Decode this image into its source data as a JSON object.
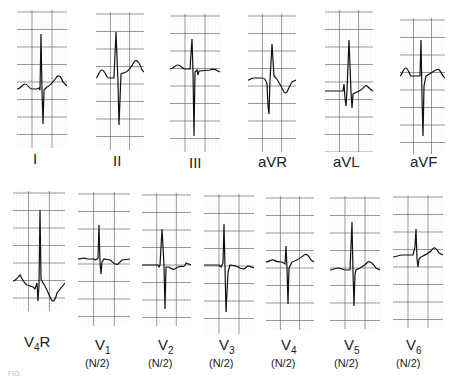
{
  "figure": {
    "caption_fragment": "FIG."
  },
  "leads": [
    {
      "id": "I",
      "label": "I",
      "sub": "",
      "x": 17,
      "y": 10,
      "w": 50,
      "h": 138,
      "baseline": 79,
      "trace": "M0,79 C4,79 5,74 8,74 C11,74 12,79 15,79 L20,79 L22,78 L23,80 L24,24 L25,80 L26,114 L27,80 L30,77 C33,76 36,72 39,68 C41,64 44,66 46,72 L50,76",
      "lx": 33,
      "ly": 150
    },
    {
      "id": "II",
      "label": "II",
      "sub": "",
      "x": 96,
      "y": 12,
      "w": 48,
      "h": 138,
      "baseline": 66,
      "trace": "M0,66 C2,66 3,58 6,58 C9,58 10,66 13,66 L18,66 L20,20 L22,70 L23,113 L25,62 L30,60 C34,58 36,54 38,50 C41,46 44,52 46,58 L48,60",
      "lx": 113,
      "ly": 152
    },
    {
      "id": "III",
      "label": "III",
      "sub": "",
      "x": 170,
      "y": 14,
      "w": 50,
      "h": 138,
      "baseline": 55,
      "trace": "M0,55 C3,55 5,51 8,51 C11,51 12,55 15,55 L20,55 L22,25 L23,58 L24,122 L25,58 L27,56 L28,61 L29,57 L40,56 C43,54 45,55 48,57 L50,58",
      "lx": 189,
      "ly": 154
    },
    {
      "id": "aVR",
      "label": "aVR",
      "sub": "",
      "x": 248,
      "y": 14,
      "w": 48,
      "h": 138,
      "baseline": 66,
      "trace": "M0,66 C2,66 3,64 6,64 L14,64 C17,64 18,66 19,70 L20,92 L21,100 L22,66 L24,30 L26,62 L28,64 C31,68 33,72 36,78 C39,82 41,72 44,68 L48,66",
      "lx": 258,
      "ly": 153
    },
    {
      "id": "aVL",
      "label": "aVL",
      "sub": "",
      "x": 325,
      "y": 10,
      "w": 48,
      "h": 142,
      "baseline": 81,
      "trace": "M0,81 L18,81 L19,74 L20,88 L21,96 L22,81 L24,30 L26,82 L27,98 L28,84 L34,81 C38,80 40,74 42,76 C44,78 46,80 48,81",
      "lx": 333,
      "ly": 153
    },
    {
      "id": "aVF",
      "label": "aVF",
      "sub": "",
      "x": 400,
      "y": 18,
      "w": 45,
      "h": 136,
      "baseline": 58,
      "trace": "M0,58 C2,58 3,50 6,50 C8,50 9,56 11,58 L20,58 L21,22 L22,78 L23,118 L24,68 L26,58 C30,56 32,54 36,52 C39,50 41,54 43,58 L45,60",
      "lx": 410,
      "ly": 153
    },
    {
      "id": "V4R",
      "label": "V",
      "sub": "4",
      "suffix": "R",
      "x": 13,
      "y": 191,
      "w": 52,
      "h": 120,
      "baseline": 90,
      "trace": "M0,90 C3,90 5,86 7,84 C9,88 11,92 14,94 L20,96 L22,98 L24,92 L25,110 L26,94 L27,19 L28,88 L30,92 C33,96 35,102 38,108 C40,112 42,110 44,102 L52,92",
      "lx": 24,
      "ly": 333,
      "nx": "",
      "ny": 0
    },
    {
      "id": "V1",
      "label": "V",
      "sub": "1",
      "suffix": "",
      "x": 78,
      "y": 192,
      "w": 52,
      "h": 134,
      "baseline": 67,
      "trace": "M0,67 C3,67 6,65 9,67 L16,67 C18,69 19,67 20,66 L21,33 L22,70 L23,82 L24,70 L26,67 L32,68 C35,70 37,74 40,72 L44,68 L52,67",
      "lx": 95,
      "ly": 336,
      "nx": "(N/2)",
      "ny": 357
    },
    {
      "id": "V2",
      "label": "V",
      "sub": "2",
      "suffix": "",
      "x": 142,
      "y": 193,
      "w": 49,
      "h": 133,
      "baseline": 72,
      "trace": "M0,72 L16,72 L17,74 L18,72 L20,36 L22,72 L23,116 L24,74 L27,74 C31,78 33,76 36,74 C40,72 42,76 44,70 L49,72",
      "lx": 158,
      "ly": 336,
      "nx": "(N/2)",
      "ny": 357
    },
    {
      "id": "V3",
      "label": "V",
      "sub": "3",
      "suffix": "",
      "x": 204,
      "y": 194,
      "w": 50,
      "h": 140,
      "baseline": 71,
      "trace": "M0,71 L15,71 L17,73 L19,69 L20,30 L21,74 L22,118 L24,78 L26,71 L32,72 L36,74 L40,75 L44,72 L50,74",
      "lx": 219,
      "ly": 336,
      "nx": "(N/2)",
      "ny": 357
    },
    {
      "id": "V4",
      "label": "V",
      "sub": "4",
      "suffix": "",
      "x": 266,
      "y": 196,
      "w": 48,
      "h": 134,
      "baseline": 66,
      "trace": "M0,66 C3,66 5,63 8,64 C10,66 12,66 16,66 L19,68 L20,50 L21,72 L22,108 L23,72 L26,66 C30,65 34,62 37,60 C40,56 43,60 45,64 L48,66",
      "lx": 281,
      "ly": 336,
      "nx": "(N/2)",
      "ny": 357
    },
    {
      "id": "V5",
      "label": "V",
      "sub": "5",
      "suffix": "",
      "x": 330,
      "y": 196,
      "w": 50,
      "h": 133,
      "baseline": 74,
      "trace": "M0,74 C3,74 5,72 8,72 C11,72 13,74 16,74 L20,74 L22,26 L23,76 L24,110 L25,78 L26,74 L30,72 C34,70 36,68 38,66 C41,64 44,70 46,72 L50,74",
      "lx": 344,
      "ly": 336,
      "nx": "(N/2)",
      "ny": 357
    },
    {
      "id": "V6",
      "label": "V",
      "sub": "6",
      "suffix": "",
      "x": 393,
      "y": 195,
      "w": 50,
      "h": 133,
      "baseline": 62,
      "trace": "M0,62 C3,62 6,60 9,60 L20,60 L22,52 L23,34 L24,64 L25,72 L26,64 L28,62 C32,60 36,58 38,56 C41,50 44,54 46,58 L50,60",
      "lx": 406,
      "ly": 336,
      "nx": "(N/2)",
      "ny": 357
    }
  ]
}
